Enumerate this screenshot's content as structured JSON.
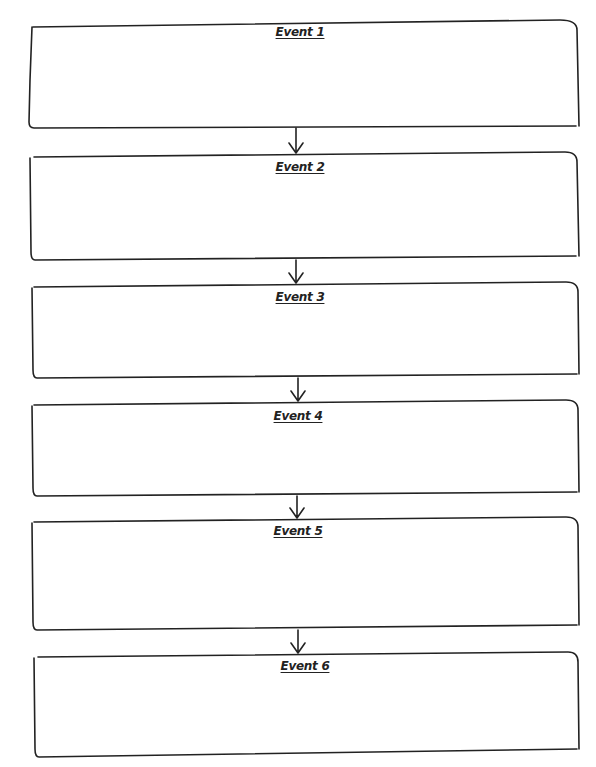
{
  "diagram": {
    "type": "sequence-chart",
    "direction": "top-to-bottom",
    "stroke_color": "#222222",
    "background": "#ffffff",
    "events": [
      {
        "label": "Event 1",
        "box": [
          31,
          20,
          580,
          128
        ]
      },
      {
        "label": "Event 2",
        "box": [
          30,
          152,
          580,
          260
        ]
      },
      {
        "label": "Event 3",
        "box": [
          32,
          282,
          580,
          378
        ]
      },
      {
        "label": "Event 4",
        "box": [
          32,
          400,
          580,
          496
        ]
      },
      {
        "label": "Event 5",
        "box": [
          32,
          517,
          580,
          630
        ]
      },
      {
        "label": "Event 6",
        "box": [
          32,
          652,
          580,
          760
        ]
      }
    ],
    "arrows": [
      {
        "from": "Event 1",
        "to": "Event 2",
        "x": 296
      },
      {
        "from": "Event 2",
        "to": "Event 3",
        "x": 296
      },
      {
        "from": "Event 3",
        "to": "Event 4",
        "x": 298
      },
      {
        "from": "Event 4",
        "to": "Event 5",
        "x": 297
      },
      {
        "from": "Event 5",
        "to": "Event 6",
        "x": 298
      }
    ]
  }
}
